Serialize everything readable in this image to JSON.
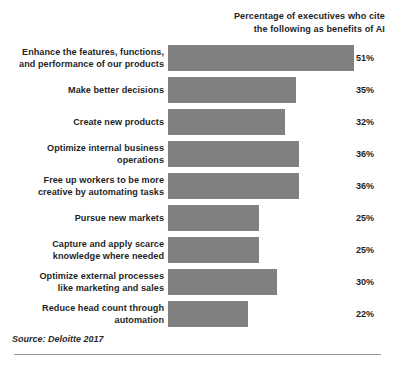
{
  "header": {
    "note_line_1": "Percentage of executives who cite",
    "note_line_2": "the following as benefits of AI"
  },
  "source": {
    "text": "Source: Deloitte 2017"
  },
  "style": {
    "bar_color": "#808080",
    "text_color": "#1f1f1f",
    "rule_color": "#9a9a9a",
    "background": "#ffffff"
  },
  "rows": [
    {
      "label_lines": [
        "Enhance the features, functions,",
        "and performance of our products"
      ],
      "label_full": "Enhance the features, functions, and performance of our products",
      "value": 51,
      "value_label": "51%"
    },
    {
      "label_lines": [
        "Make better decisions"
      ],
      "label_full": "Make better decisions",
      "value": 35,
      "value_label": "35%"
    },
    {
      "label_lines": [
        "Create new products"
      ],
      "label_full": "Create new products",
      "value": 32,
      "value_label": "32%"
    },
    {
      "label_lines": [
        "Optimize internal business",
        "operations"
      ],
      "label_full": "Optimize internal business operations",
      "value": 36,
      "value_label": "36%"
    },
    {
      "label_lines": [
        "Free up workers to be more",
        "creative by automating tasks"
      ],
      "label_full": "Free up workers to be more creative by automating tasks",
      "value": 36,
      "value_label": "36%"
    },
    {
      "label_lines": [
        "Pursue new markets"
      ],
      "label_full": "Pursue new markets",
      "value": 25,
      "value_label": "25%"
    },
    {
      "label_lines": [
        "Capture and apply scarce",
        "knowledge where needed"
      ],
      "label_full": "Capture and apply scarce knowledge where needed",
      "value": 25,
      "value_label": "25%"
    },
    {
      "label_lines": [
        "Optimize external processes",
        "like marketing and sales"
      ],
      "label_full": "Optimize external processes like marketing and sales",
      "value": 30,
      "value_label": "30%"
    },
    {
      "label_lines": [
        "Reduce head count through",
        "automation"
      ],
      "label_full": "Reduce head count through automation",
      "value": 22,
      "value_label": "22%"
    }
  ],
  "chart_data": {
    "type": "bar",
    "orientation": "horizontal",
    "title": "",
    "subtitle": "Percentage of executives who cite the following as benefits of AI",
    "xlabel": "",
    "ylabel": "",
    "categories": [
      "Enhance the features, functions, and performance of our products",
      "Make better decisions",
      "Create new products",
      "Optimize internal business operations",
      "Free up workers to be more creative by automating tasks",
      "Pursue new markets",
      "Capture and apply scarce knowledge where needed",
      "Optimize external processes like marketing and sales",
      "Reduce head count through automation"
    ],
    "values": [
      51,
      35,
      32,
      36,
      36,
      25,
      25,
      30,
      22
    ],
    "value_labels": [
      "51%",
      "35%",
      "32%",
      "36%",
      "36%",
      "25%",
      "25%",
      "30%",
      "22%"
    ],
    "unit": "%",
    "xlim": [
      0,
      51
    ],
    "grid": false,
    "legend": false,
    "legend_position": "none",
    "bar_color": "#808080",
    "annotations": [
      "Source: Deloitte 2017"
    ]
  }
}
